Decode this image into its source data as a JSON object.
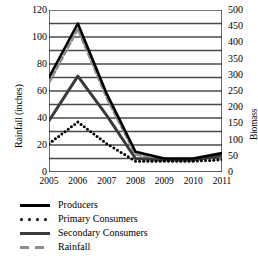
{
  "chart_data": {
    "type": "line",
    "title": "",
    "xlabel": "",
    "ylabel": "Rainfall (inches)",
    "y2label": "Biomass",
    "x": [
      2005,
      2006,
      2007,
      2008,
      2009,
      2010,
      2011
    ],
    "categories": [
      "2005",
      "2006",
      "2007",
      "2008",
      "2009",
      "2010",
      "2011"
    ],
    "xtick_labels": [
      "2005",
      "2006",
      "2007",
      "2008",
      "2009",
      "2010",
      "2011"
    ],
    "ytick_labels": [
      "120",
      "100",
      "80",
      "60",
      "40",
      "20",
      "0"
    ],
    "ytick_values": [
      120,
      100,
      80,
      60,
      40,
      20,
      0
    ],
    "y2tick_labels": [
      "500",
      "450",
      "400",
      "350",
      "300",
      "250",
      "200",
      "150",
      "100",
      "50",
      "0"
    ],
    "y2tick_values": [
      500,
      450,
      400,
      350,
      300,
      250,
      200,
      150,
      100,
      50,
      0
    ],
    "ylim": [
      0,
      120
    ],
    "y2lim": [
      0,
      500
    ],
    "xlim": [
      2005,
      2011
    ],
    "grid": true,
    "gridline_values": [
      120,
      110,
      100,
      90,
      80,
      70,
      60,
      50,
      40,
      30,
      20,
      10
    ],
    "legend_position": "below",
    "series": [
      {
        "name": "Producers",
        "axis": "right",
        "style": "solid",
        "color": "#000000",
        "width": 2.6,
        "values_left_axis": [
          70,
          110,
          58,
          15,
          10,
          10,
          14
        ],
        "values": [
          292,
          458,
          242,
          63,
          42,
          42,
          58
        ]
      },
      {
        "name": "Primary Consumers",
        "axis": "right",
        "style": "dotted",
        "color": "#000000",
        "width": 2.6,
        "values_left_axis": [
          21,
          37,
          21,
          8,
          8,
          8,
          9
        ],
        "values": [
          88,
          154,
          88,
          33,
          33,
          33,
          38
        ]
      },
      {
        "name": "Secondary Consumers",
        "axis": "right",
        "style": "solid",
        "color": "#3a3a3a",
        "width": 3.0,
        "values_left_axis": [
          38,
          71,
          42,
          10,
          9,
          9,
          12
        ],
        "values": [
          158,
          296,
          175,
          42,
          38,
          38,
          50
        ]
      },
      {
        "name": "Rainfall",
        "axis": "left",
        "style": "dashed",
        "color": "#8c8c8c",
        "width": 2.6,
        "values": [
          66,
          106,
          55,
          13,
          9,
          9,
          12
        ]
      }
    ]
  },
  "axes": {
    "left_title": "Rainfall (inches)",
    "right_title": "Biomass",
    "left_ticks": [
      "120",
      "100",
      "80",
      "60",
      "40",
      "20",
      "0"
    ],
    "right_ticks": [
      "500",
      "450",
      "400",
      "350",
      "300",
      "250",
      "200",
      "150",
      "100",
      "50",
      "0"
    ],
    "x_ticks": [
      "2005",
      "2006",
      "2007",
      "2008",
      "2009",
      "2010",
      "2011"
    ]
  },
  "legend": {
    "items": [
      {
        "label": "Producers",
        "key": "solid-black-line-key"
      },
      {
        "label": "Primary Consumers",
        "key": "dotted-line-key"
      },
      {
        "label": "Secondary Consumers",
        "key": "solid-gray-line-key"
      },
      {
        "label": "Rainfall",
        "key": "dashed-gray-line-key"
      }
    ]
  }
}
